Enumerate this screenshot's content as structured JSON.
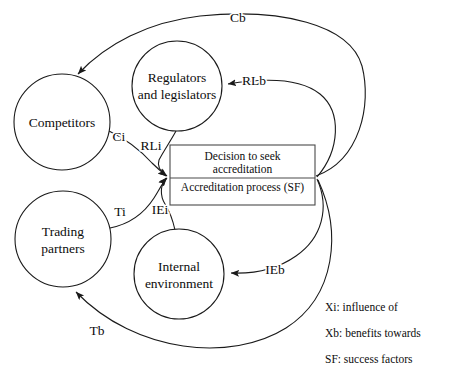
{
  "diagram": {
    "nodes": [
      {
        "id": "competitors",
        "label_lines": [
          "Competitors"
        ],
        "cx": 62,
        "cy": 122,
        "r": 48
      },
      {
        "id": "regulators",
        "label_lines": [
          "Regulators",
          "and legislators"
        ],
        "cx": 177,
        "cy": 86,
        "r": 45
      },
      {
        "id": "trading-partners",
        "label_lines": [
          "Trading",
          "partners"
        ],
        "cx": 63,
        "cy": 239,
        "r": 48
      },
      {
        "id": "internal-environment",
        "label_lines": [
          "Internal",
          "environment"
        ],
        "cx": 179,
        "cy": 274,
        "r": 45
      }
    ],
    "process_box": {
      "id": "accreditation-box",
      "top_lines": [
        "Decision to seek",
        "accreditation"
      ],
      "bottom_line": "Accreditation process (SF)",
      "x": 170,
      "y": 145,
      "width": 145,
      "height": 60,
      "divider_y": 178
    },
    "edge_labels": [
      {
        "id": "Cb",
        "text": "Cb",
        "x": 238,
        "y": 22
      },
      {
        "id": "RLb",
        "text": "RLb",
        "x": 254,
        "y": 85
      },
      {
        "id": "Ci",
        "text": "Ci",
        "x": 119,
        "y": 141
      },
      {
        "id": "RLi",
        "text": "RLi",
        "x": 151,
        "y": 150
      },
      {
        "id": "Ti",
        "text": "Ti",
        "x": 120,
        "y": 216
      },
      {
        "id": "IEi",
        "text": "IEi",
        "x": 160,
        "y": 214
      },
      {
        "id": "IEb",
        "text": "IEb",
        "x": 275,
        "y": 274
      },
      {
        "id": "Tb",
        "text": "Tb",
        "x": 97,
        "y": 335
      }
    ],
    "legend": {
      "lines": [
        "Xi: influence of",
        "Xb: benefits towards",
        "SF: success factors"
      ],
      "x": 325,
      "y_start": 311,
      "line_gap": 26
    },
    "colors": {
      "stroke": "#1a1a1a",
      "box_stroke": "#4a4a4a",
      "text": "#0d0d0d",
      "background": "#ffffff"
    }
  }
}
